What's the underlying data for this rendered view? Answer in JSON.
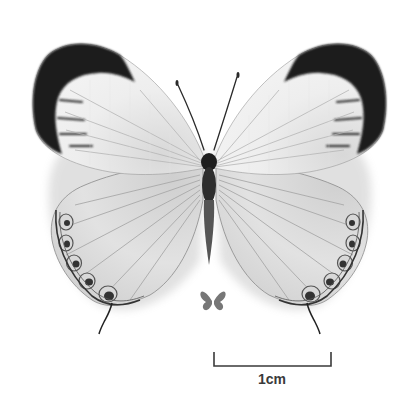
{
  "image": {
    "subject": "butterfly specimen (dorsal view)",
    "colors": {
      "background": "#ffffff",
      "wing_base": "#e6e6e6",
      "wing_tip_dark": "#1a1a1a",
      "body": "#2b2b2b",
      "silhouette": "#777777",
      "scale_bar": "#3a3a3a"
    }
  },
  "scale_bar": {
    "label": "1cm"
  },
  "icons": {
    "size_silhouette": "butterfly-silhouette-icon"
  }
}
